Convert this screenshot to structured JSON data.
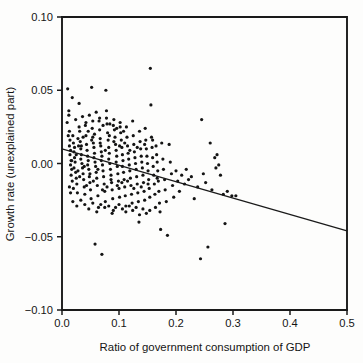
{
  "chart_data": {
    "type": "scatter",
    "title": "",
    "xlabel": "Ratio of government consumption of GDP",
    "ylabel": "Growth rate (unexplained part)",
    "xlim": [
      0.0,
      0.5
    ],
    "ylim": [
      -0.1,
      0.1
    ],
    "xticks": [
      0.0,
      0.1,
      0.2,
      0.3,
      0.4,
      0.5
    ],
    "xtick_labels": [
      "0.0",
      "0.1",
      "0.2",
      "0.3",
      "0.4",
      "0.5"
    ],
    "yticks": [
      -0.1,
      -0.05,
      0.0,
      0.05,
      0.1
    ],
    "ytick_labels": [
      "-0.10",
      "-0.05",
      "0.00",
      "0.05",
      "0.10"
    ],
    "grid": false,
    "legend": null,
    "marker": "dot",
    "marker_color": "#141414",
    "marker_size": 1.6,
    "series": [
      {
        "name": "countries",
        "points": [
          [
            0.01,
            0.051
          ],
          [
            0.012,
            0.036
          ],
          [
            0.012,
            0.033
          ],
          [
            0.013,
            0.022
          ],
          [
            0.014,
            0.016
          ],
          [
            0.013,
            0.012
          ],
          [
            0.015,
            0.009
          ],
          [
            0.014,
            0.006
          ],
          [
            0.016,
            0.002
          ],
          [
            0.015,
            -0.001
          ],
          [
            0.017,
            -0.004
          ],
          [
            0.016,
            -0.008
          ],
          [
            0.018,
            -0.012
          ],
          [
            0.019,
            0.019
          ],
          [
            0.02,
            0.014
          ],
          [
            0.021,
            0.008
          ],
          [
            0.022,
            0.004
          ],
          [
            0.023,
            0.001
          ],
          [
            0.021,
            -0.003
          ],
          [
            0.024,
            -0.006
          ],
          [
            0.025,
            -0.01
          ],
          [
            0.026,
            -0.014
          ],
          [
            0.027,
            -0.02
          ],
          [
            0.028,
            0.017
          ],
          [
            0.029,
            0.012
          ],
          [
            0.03,
            0.041
          ],
          [
            0.031,
            0.022
          ],
          [
            0.032,
            0.015
          ],
          [
            0.033,
            0.01
          ],
          [
            0.034,
            0.006
          ],
          [
            0.033,
            0.003
          ],
          [
            0.035,
            0.0
          ],
          [
            0.036,
            -0.003
          ],
          [
            0.037,
            -0.007
          ],
          [
            0.038,
            -0.011
          ],
          [
            0.039,
            -0.016
          ],
          [
            0.04,
            -0.021
          ],
          [
            0.041,
            0.026
          ],
          [
            0.042,
            0.019
          ],
          [
            0.043,
            0.013
          ],
          [
            0.044,
            0.009
          ],
          [
            0.045,
            0.005
          ],
          [
            0.046,
            0.002
          ],
          [
            0.045,
            -0.001
          ],
          [
            0.047,
            -0.004
          ],
          [
            0.048,
            -0.009
          ],
          [
            0.049,
            -0.013
          ],
          [
            0.05,
            -0.018
          ],
          [
            0.051,
            -0.024
          ],
          [
            0.052,
            0.052
          ],
          [
            0.053,
            0.024
          ],
          [
            0.054,
            0.018
          ],
          [
            0.055,
            0.014
          ],
          [
            0.056,
            0.011
          ],
          [
            0.057,
            0.007
          ],
          [
            0.056,
            0.004
          ],
          [
            0.058,
            0.001
          ],
          [
            0.059,
            -0.002
          ],
          [
            0.06,
            -0.006
          ],
          [
            0.061,
            -0.01
          ],
          [
            0.062,
            -0.015
          ],
          [
            0.063,
            -0.022
          ],
          [
            0.064,
            -0.03
          ],
          [
            0.065,
            0.029
          ],
          [
            0.066,
            0.023
          ],
          [
            0.067,
            0.017
          ],
          [
            0.068,
            0.012
          ],
          [
            0.069,
            0.008
          ],
          [
            0.07,
            0.005
          ],
          [
            0.069,
            0.002
          ],
          [
            0.071,
            -0.001
          ],
          [
            0.072,
            -0.005
          ],
          [
            0.073,
            -0.009
          ],
          [
            0.074,
            -0.014
          ],
          [
            0.075,
            -0.019
          ],
          [
            0.076,
            -0.026
          ],
          [
            0.077,
            0.05
          ],
          [
            0.078,
            0.036
          ],
          [
            0.079,
            0.027
          ],
          [
            0.08,
            0.021
          ],
          [
            0.081,
            0.016
          ],
          [
            0.082,
            0.011
          ],
          [
            0.083,
            0.007
          ],
          [
            0.082,
            0.003
          ],
          [
            0.084,
            0.0
          ],
          [
            0.085,
            -0.004
          ],
          [
            0.086,
            -0.008
          ],
          [
            0.087,
            -0.013
          ],
          [
            0.088,
            -0.018
          ],
          [
            0.089,
            -0.024
          ],
          [
            0.09,
            -0.032
          ],
          [
            0.091,
            0.03
          ],
          [
            0.092,
            0.023
          ],
          [
            0.093,
            0.018
          ],
          [
            0.094,
            0.013
          ],
          [
            0.095,
            0.009
          ],
          [
            0.096,
            0.005
          ],
          [
            0.095,
            0.001
          ],
          [
            0.097,
            -0.002
          ],
          [
            0.098,
            -0.007
          ],
          [
            0.099,
            -0.012
          ],
          [
            0.1,
            -0.017
          ],
          [
            0.101,
            -0.023
          ],
          [
            0.102,
            0.028
          ],
          [
            0.103,
            0.021
          ],
          [
            0.104,
            0.016
          ],
          [
            0.105,
            0.011
          ],
          [
            0.106,
            0.006
          ],
          [
            0.107,
            0.002
          ],
          [
            0.106,
            -0.002
          ],
          [
            0.108,
            -0.006
          ],
          [
            0.109,
            -0.011
          ],
          [
            0.11,
            -0.016
          ],
          [
            0.111,
            -0.022
          ],
          [
            0.112,
            -0.029
          ],
          [
            0.113,
            0.025
          ],
          [
            0.114,
            0.018
          ],
          [
            0.115,
            0.012
          ],
          [
            0.116,
            0.007
          ],
          [
            0.117,
            0.003
          ],
          [
            0.118,
            -0.001
          ],
          [
            0.119,
            -0.005
          ],
          [
            0.12,
            -0.01
          ],
          [
            0.121,
            -0.015
          ],
          [
            0.122,
            -0.021
          ],
          [
            0.123,
            -0.027
          ],
          [
            0.124,
            0.029
          ],
          [
            0.125,
            0.019
          ],
          [
            0.126,
            0.013
          ],
          [
            0.127,
            0.008
          ],
          [
            0.128,
            0.004
          ],
          [
            0.129,
            0.0
          ],
          [
            0.13,
            -0.004
          ],
          [
            0.131,
            -0.009
          ],
          [
            0.132,
            -0.014
          ],
          [
            0.133,
            -0.02
          ],
          [
            0.134,
            -0.026
          ],
          [
            0.135,
            -0.04
          ],
          [
            0.136,
            0.022
          ],
          [
            0.137,
            0.015
          ],
          [
            0.138,
            0.01
          ],
          [
            0.139,
            0.005
          ],
          [
            0.14,
            0.001
          ],
          [
            0.141,
            -0.003
          ],
          [
            0.142,
            -0.008
          ],
          [
            0.143,
            -0.013
          ],
          [
            0.144,
            -0.019
          ],
          [
            0.145,
            -0.025
          ],
          [
            0.146,
            0.024
          ],
          [
            0.147,
            0.016
          ],
          [
            0.148,
            0.01
          ],
          [
            0.149,
            0.005
          ],
          [
            0.15,
            0.0
          ],
          [
            0.151,
            -0.005
          ],
          [
            0.152,
            -0.011
          ],
          [
            0.153,
            -0.017
          ],
          [
            0.154,
            -0.023
          ],
          [
            0.155,
            0.065
          ],
          [
            0.156,
            0.04
          ],
          [
            0.157,
            0.018
          ],
          [
            0.158,
            0.011
          ],
          [
            0.159,
            0.004
          ],
          [
            0.16,
            -0.002
          ],
          [
            0.161,
            -0.008
          ],
          [
            0.162,
            -0.014
          ],
          [
            0.163,
            -0.021
          ],
          [
            0.164,
            -0.03
          ],
          [
            0.165,
            0.012
          ],
          [
            0.166,
            0.006
          ],
          [
            0.167,
            0.001
          ],
          [
            0.168,
            -0.005
          ],
          [
            0.169,
            -0.012
          ],
          [
            0.17,
            -0.019
          ],
          [
            0.171,
            -0.027
          ],
          [
            0.172,
            -0.033
          ],
          [
            0.173,
            -0.045
          ],
          [
            0.175,
            0.014
          ],
          [
            0.177,
            0.003
          ],
          [
            0.178,
            -0.004
          ],
          [
            0.18,
            -0.011
          ],
          [
            0.181,
            -0.018
          ],
          [
            0.183,
            -0.026
          ],
          [
            0.185,
            -0.049
          ],
          [
            0.188,
            0.013
          ],
          [
            0.19,
            0.001
          ],
          [
            0.192,
            -0.007
          ],
          [
            0.194,
            -0.015
          ],
          [
            0.196,
            -0.023
          ],
          [
            0.2,
            -0.005
          ],
          [
            0.203,
            -0.012
          ],
          [
            0.206,
            -0.019
          ],
          [
            0.21,
            -0.008
          ],
          [
            0.215,
            -0.014
          ],
          [
            0.218,
            -0.004
          ],
          [
            0.222,
            -0.011
          ],
          [
            0.227,
            -0.009
          ],
          [
            0.232,
            -0.024
          ],
          [
            0.238,
            -0.016
          ],
          [
            0.243,
            -0.065
          ],
          [
            0.245,
            0.03
          ],
          [
            0.248,
            -0.007
          ],
          [
            0.252,
            -0.013
          ],
          [
            0.256,
            -0.057
          ],
          [
            0.26,
            0.014
          ],
          [
            0.263,
            -0.018
          ],
          [
            0.268,
            0.004
          ],
          [
            0.27,
            -0.003
          ],
          [
            0.272,
            0.006
          ],
          [
            0.275,
            -0.001
          ],
          [
            0.278,
            -0.008
          ],
          [
            0.283,
            -0.021
          ],
          [
            0.286,
            -0.041
          ],
          [
            0.29,
            -0.019
          ],
          [
            0.298,
            -0.022
          ],
          [
            0.305,
            -0.022
          ],
          [
            0.018,
            0.045
          ],
          [
            0.024,
            0.03
          ],
          [
            0.03,
            0.025
          ],
          [
            0.036,
            0.032
          ],
          [
            0.042,
            0.028
          ],
          [
            0.048,
            0.033
          ],
          [
            0.054,
            0.029
          ],
          [
            0.06,
            0.035
          ],
          [
            0.066,
            0.031
          ],
          [
            0.072,
            0.026
          ],
          [
            0.078,
            0.031
          ],
          [
            0.084,
            0.027
          ],
          [
            0.09,
            0.026
          ],
          [
            0.096,
            0.024
          ],
          [
            0.102,
            0.025
          ],
          [
            0.108,
            0.022
          ],
          [
            0.019,
            -0.026
          ],
          [
            0.026,
            -0.029
          ],
          [
            0.033,
            -0.025
          ],
          [
            0.04,
            -0.028
          ],
          [
            0.047,
            -0.031
          ],
          [
            0.054,
            -0.027
          ],
          [
            0.058,
            -0.055
          ],
          [
            0.061,
            -0.033
          ],
          [
            0.068,
            -0.028
          ],
          [
            0.07,
            -0.062
          ],
          [
            0.075,
            -0.03
          ],
          [
            0.082,
            -0.029
          ],
          [
            0.088,
            -0.034
          ],
          [
            0.094,
            -0.03
          ],
          [
            0.1,
            -0.028
          ],
          [
            0.106,
            -0.031
          ],
          [
            0.112,
            -0.033
          ],
          [
            0.118,
            -0.029
          ],
          [
            0.124,
            -0.032
          ],
          [
            0.13,
            -0.03
          ],
          [
            0.136,
            -0.035
          ],
          [
            0.142,
            -0.031
          ],
          [
            0.148,
            -0.034
          ],
          [
            0.154,
            -0.032
          ],
          [
            0.009,
            0.028
          ],
          [
            0.011,
            0.019
          ],
          [
            0.013,
            -0.016
          ],
          [
            0.015,
            -0.02
          ],
          [
            0.017,
            0.002
          ],
          [
            0.02,
            -0.017
          ],
          [
            0.022,
            0.011
          ],
          [
            0.025,
            0.006
          ],
          [
            0.028,
            -0.005
          ],
          [
            0.031,
            -0.009
          ],
          [
            0.034,
            0.012
          ],
          [
            0.037,
            0.018
          ],
          [
            0.039,
            -0.002
          ],
          [
            0.043,
            -0.015
          ],
          [
            0.046,
            0.022
          ],
          [
            0.049,
            -0.007
          ],
          [
            0.052,
            0.016
          ],
          [
            0.055,
            -0.012
          ],
          [
            0.057,
            0.02
          ],
          [
            0.063,
            -0.004
          ],
          [
            0.067,
            0.014
          ],
          [
            0.071,
            -0.018
          ],
          [
            0.076,
            0.009
          ],
          [
            0.079,
            -0.016
          ],
          [
            0.083,
            0.019
          ],
          [
            0.086,
            -0.011
          ],
          [
            0.091,
            0.015
          ],
          [
            0.097,
            -0.015
          ],
          [
            0.101,
            0.012
          ],
          [
            0.105,
            -0.013
          ],
          [
            0.11,
            0.014
          ],
          [
            0.115,
            -0.012
          ],
          [
            0.119,
            0.009
          ],
          [
            0.126,
            -0.017
          ],
          [
            0.132,
            0.011
          ],
          [
            0.139,
            -0.016
          ],
          [
            0.145,
            0.013
          ],
          [
            0.151,
            -0.014
          ],
          [
            0.159,
            0.016
          ],
          [
            0.167,
            -0.01
          ]
        ]
      }
    ],
    "fit_line": {
      "name": "regression-line",
      "x0": 0.0,
      "y0": 0.01,
      "x1": 0.5,
      "y1": -0.046,
      "slope": -0.112,
      "intercept": 0.01
    }
  }
}
